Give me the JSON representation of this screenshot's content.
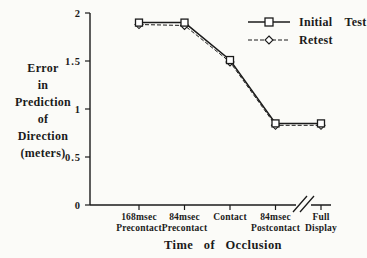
{
  "figure": {
    "background": "#fbfbf8",
    "ink": "#1b1b1b",
    "marker_fill": "#ffffff"
  },
  "chart_data": {
    "type": "line",
    "title": "",
    "xlabel": "Time of Occlusion",
    "ylabel": "Error in Prediction of Direction (meters)",
    "ylabel_lines": [
      "Error",
      "in",
      "Prediction",
      "of",
      "Direction",
      "(meters)"
    ],
    "categories": [
      "168msec Precontact",
      "84msec Precontact",
      "Contact",
      "84msec Postcontact",
      "Full Display"
    ],
    "category_label_lines": [
      [
        "168msec",
        "Precontact"
      ],
      [
        "84msec",
        "Precontact"
      ],
      [
        "Contact"
      ],
      [
        "84msec",
        "Postcontact"
      ],
      [
        "Full",
        "Display"
      ]
    ],
    "series": [
      {
        "name": "Initial Test",
        "marker": "square",
        "line_style": "solid",
        "values": [
          1.9,
          1.9,
          1.51,
          0.85,
          0.85
        ]
      },
      {
        "name": "Retest",
        "marker": "diamond",
        "line_style": "dashed",
        "values": [
          1.88,
          1.87,
          1.49,
          0.83,
          0.83
        ]
      }
    ],
    "ylim": [
      0,
      2
    ],
    "yticks": [
      0,
      0.5,
      1,
      1.5,
      2
    ],
    "ytick_labels": [
      "0",
      "0.5",
      "1",
      "1.5",
      "2"
    ],
    "axis_break": {
      "between": [
        "84msec Postcontact",
        "Full Display"
      ]
    },
    "legend_position": "top-right",
    "grid": false
  }
}
